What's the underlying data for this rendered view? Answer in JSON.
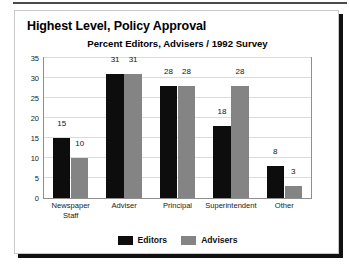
{
  "chart_data": {
    "type": "bar",
    "title": "Highest Level, Policy Approval",
    "subtitle": "Percent Editors, Advisers / 1992 Survey",
    "xlabel": "",
    "ylabel": "",
    "ylim": [
      0,
      35
    ],
    "yticks": [
      0,
      5,
      10,
      15,
      20,
      25,
      30,
      35
    ],
    "grid": true,
    "legend_position": "bottom",
    "categories": [
      "Newspaper Staff",
      "Adviser",
      "Principal",
      "Superintendent",
      "Other"
    ],
    "category_lines": [
      [
        "Newspaper",
        "Staff"
      ],
      [
        "Adviser"
      ],
      [
        "Principal"
      ],
      [
        "Superintendent"
      ],
      [
        "Other"
      ]
    ],
    "series": [
      {
        "name": "Editors",
        "color": "#0d0d0d",
        "values": [
          15,
          31,
          28,
          18,
          8
        ]
      },
      {
        "name": "Advisers",
        "color": "#848484",
        "values": [
          10,
          31,
          28,
          28,
          3
        ]
      }
    ]
  },
  "colors": {
    "editors": "#0d0d0d",
    "advisers": "#848484",
    "grid": "#dcdcdc",
    "frame": "#8f8f8f",
    "card_border": "#c9c9c9",
    "shadow": "#111111",
    "rule": "#4a4a4a"
  }
}
